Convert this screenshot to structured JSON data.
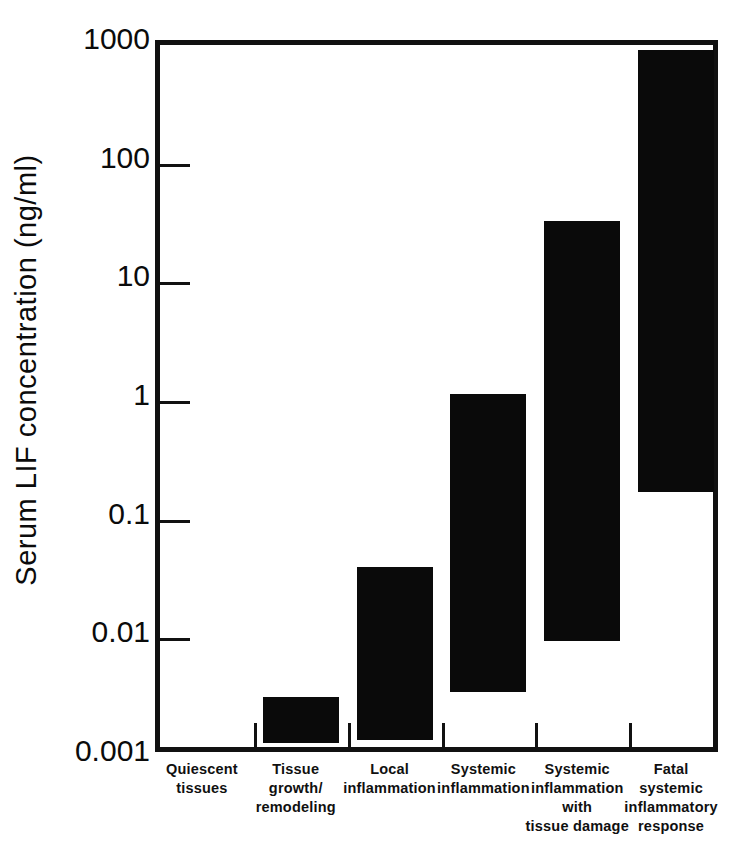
{
  "chart_data": {
    "type": "bar",
    "title": "",
    "subtitle": "",
    "xlabel": "",
    "ylabel": "Serum  LIF  concentration  (ng/ml)",
    "yscale": "log",
    "ylim": [
      0.001,
      1000
    ],
    "ytick_labels": [
      "1000",
      "100",
      "10",
      "1",
      "0.1",
      "0.01",
      "0.001"
    ],
    "ytick_values": [
      1000,
      100,
      10,
      1,
      0.1,
      0.01,
      0.001
    ],
    "grid": false,
    "legend": "none",
    "bar_color": "#0a0a0a",
    "note": "Floating bars show the range (low to high) of serum LIF concentration for each clinical category.",
    "categories": [
      "Quiescent tissues",
      "Tissue growth/ remodeling",
      "Local inflammation",
      "Systemic inflammation",
      "Systemic inflammation with tissue damage",
      "Fatal systemic inflammatory response"
    ],
    "category_lines": [
      [
        "Quiescent",
        "tissues"
      ],
      [
        "Tissue",
        "growth/",
        "remodeling"
      ],
      [
        "Local",
        "inflammation"
      ],
      [
        "Systemic",
        "inflammation"
      ],
      [
        "Systemic",
        "inflammation",
        "with",
        "tissue damage"
      ],
      [
        "Fatal",
        "systemic",
        "inflammatory",
        "response"
      ]
    ],
    "bars": [
      {
        "category": "Quiescent tissues",
        "low": null,
        "high": null
      },
      {
        "category": "Tissue growth/ remodeling",
        "low": 0.0013,
        "high": 0.0032
      },
      {
        "category": "Local inflammation",
        "low": 0.0014,
        "high": 0.04
      },
      {
        "category": "Systemic inflammation",
        "low": 0.0035,
        "high": 1.15
      },
      {
        "category": "Systemic inflammation with tissue damage",
        "low": 0.0095,
        "high": 33
      },
      {
        "category": "Fatal systemic inflammatory response",
        "low": 0.17,
        "high": 900
      }
    ]
  },
  "caption": {
    "text": ""
  }
}
